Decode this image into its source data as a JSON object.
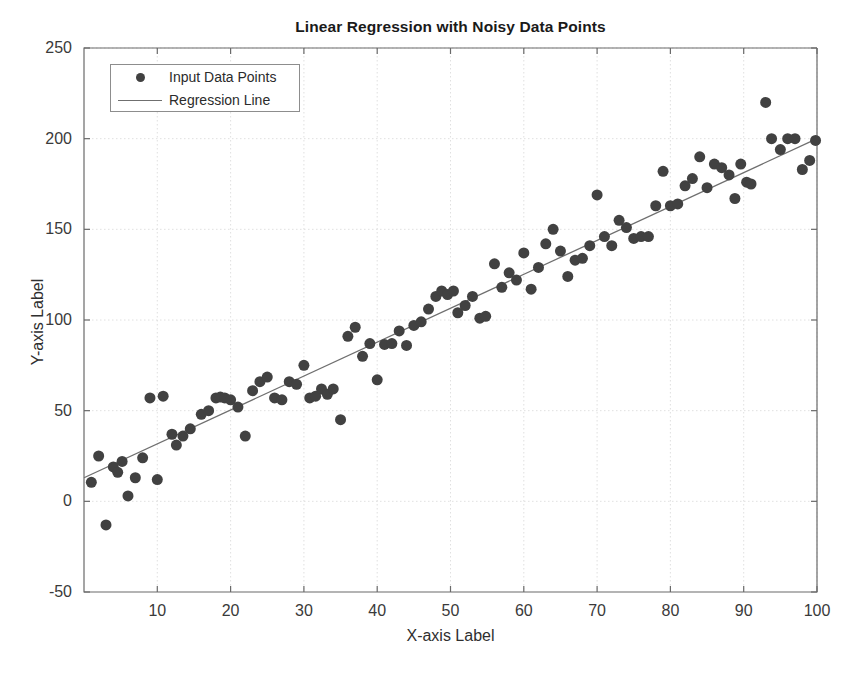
{
  "chart_data": {
    "type": "scatter",
    "title": "Linear Regression with Noisy Data Points",
    "xlabel": "X-axis Label",
    "ylabel": "Y-axis Label",
    "xlim": [
      0,
      100
    ],
    "ylim": [
      -50,
      250
    ],
    "xticks": [
      10,
      20,
      30,
      40,
      50,
      60,
      70,
      80,
      90,
      100
    ],
    "yticks": [
      -50,
      0,
      50,
      100,
      150,
      200,
      250
    ],
    "grid": true,
    "legend_position": "top-left",
    "legend": [
      {
        "label": "Input Data Points",
        "marker": "filled-circle",
        "color": "#414141"
      },
      {
        "label": "Regression Line",
        "marker": "line",
        "color": "#6f6f6f"
      }
    ],
    "series": [
      {
        "name": "Input Data Points",
        "type": "scatter",
        "color": "#414141",
        "marker_size": 11,
        "points": [
          [
            1.0,
            10.5
          ],
          [
            2.0,
            25.0
          ],
          [
            3.0,
            -13.0
          ],
          [
            4.0,
            19.0
          ],
          [
            4.6,
            16.0
          ],
          [
            5.2,
            22.0
          ],
          [
            6.0,
            3.0
          ],
          [
            7.0,
            13.0
          ],
          [
            8.0,
            24.0
          ],
          [
            9.0,
            57.0
          ],
          [
            10.0,
            12.0
          ],
          [
            10.8,
            58.0
          ],
          [
            12.0,
            37.0
          ],
          [
            12.6,
            31.0
          ],
          [
            13.5,
            36.0
          ],
          [
            14.5,
            40.0
          ],
          [
            16.0,
            48.0
          ],
          [
            17.0,
            50.0
          ],
          [
            18.0,
            57.0
          ],
          [
            18.6,
            57.5
          ],
          [
            19.2,
            57.0
          ],
          [
            20.0,
            56.0
          ],
          [
            21.0,
            52.0
          ],
          [
            22.0,
            36.0
          ],
          [
            23.0,
            61.0
          ],
          [
            24.0,
            66.0
          ],
          [
            25.0,
            68.5
          ],
          [
            26.0,
            57.0
          ],
          [
            27.0,
            56.0
          ],
          [
            28.0,
            66.0
          ],
          [
            29.0,
            64.5
          ],
          [
            30.0,
            75.0
          ],
          [
            30.8,
            57.0
          ],
          [
            31.6,
            58.0
          ],
          [
            32.4,
            62.0
          ],
          [
            33.2,
            59.0
          ],
          [
            34.0,
            62.0
          ],
          [
            35.0,
            45.0
          ],
          [
            36.0,
            91.0
          ],
          [
            37.0,
            96.0
          ],
          [
            38.0,
            80.0
          ],
          [
            39.0,
            87.0
          ],
          [
            40.0,
            67.0
          ],
          [
            41.0,
            86.5
          ],
          [
            42.0,
            87.0
          ],
          [
            43.0,
            94.0
          ],
          [
            44.0,
            86.0
          ],
          [
            45.0,
            97.0
          ],
          [
            46.0,
            99.0
          ],
          [
            47.0,
            106.0
          ],
          [
            48.0,
            113.0
          ],
          [
            48.8,
            116.0
          ],
          [
            49.6,
            114.0
          ],
          [
            50.4,
            116.0
          ],
          [
            51.0,
            104.0
          ],
          [
            52.0,
            108.0
          ],
          [
            53.0,
            113.0
          ],
          [
            54.0,
            101.0
          ],
          [
            54.8,
            102.0
          ],
          [
            56.0,
            131.0
          ],
          [
            57.0,
            118.0
          ],
          [
            58.0,
            126.0
          ],
          [
            59.0,
            122.0
          ],
          [
            60.0,
            137.0
          ],
          [
            61.0,
            117.0
          ],
          [
            62.0,
            129.0
          ],
          [
            63.0,
            142.0
          ],
          [
            64.0,
            150.0
          ],
          [
            65.0,
            138.0
          ],
          [
            66.0,
            124.0
          ],
          [
            67.0,
            133.0
          ],
          [
            68.0,
            134.0
          ],
          [
            69.0,
            141.0
          ],
          [
            70.0,
            169.0
          ],
          [
            71.0,
            146.0
          ],
          [
            72.0,
            141.0
          ],
          [
            73.0,
            155.0
          ],
          [
            74.0,
            151.0
          ],
          [
            75.0,
            145.0
          ],
          [
            76.0,
            146.0
          ],
          [
            77.0,
            146.0
          ],
          [
            78.0,
            163.0
          ],
          [
            79.0,
            182.0
          ],
          [
            80.0,
            163.0
          ],
          [
            81.0,
            164.0
          ],
          [
            82.0,
            174.0
          ],
          [
            83.0,
            178.0
          ],
          [
            84.0,
            190.0
          ],
          [
            85.0,
            173.0
          ],
          [
            86.0,
            186.0
          ],
          [
            87.0,
            184.0
          ],
          [
            88.0,
            180.0
          ],
          [
            88.8,
            167.0
          ],
          [
            89.6,
            186.0
          ],
          [
            90.4,
            176.0
          ],
          [
            91.0,
            175.0
          ],
          [
            93.0,
            220.0
          ],
          [
            93.8,
            200.0
          ],
          [
            95.0,
            194.0
          ],
          [
            96.0,
            200.0
          ],
          [
            97.0,
            200.0
          ],
          [
            98.0,
            183.0
          ],
          [
            99.0,
            188.0
          ],
          [
            99.8,
            199.0
          ]
        ]
      },
      {
        "name": "Regression Line",
        "type": "line",
        "color": "#6f6f6f",
        "slope": 1.87,
        "intercept": 13.0,
        "endpoints": [
          [
            0,
            13.0
          ],
          [
            100,
            200.0
          ]
        ]
      }
    ]
  }
}
